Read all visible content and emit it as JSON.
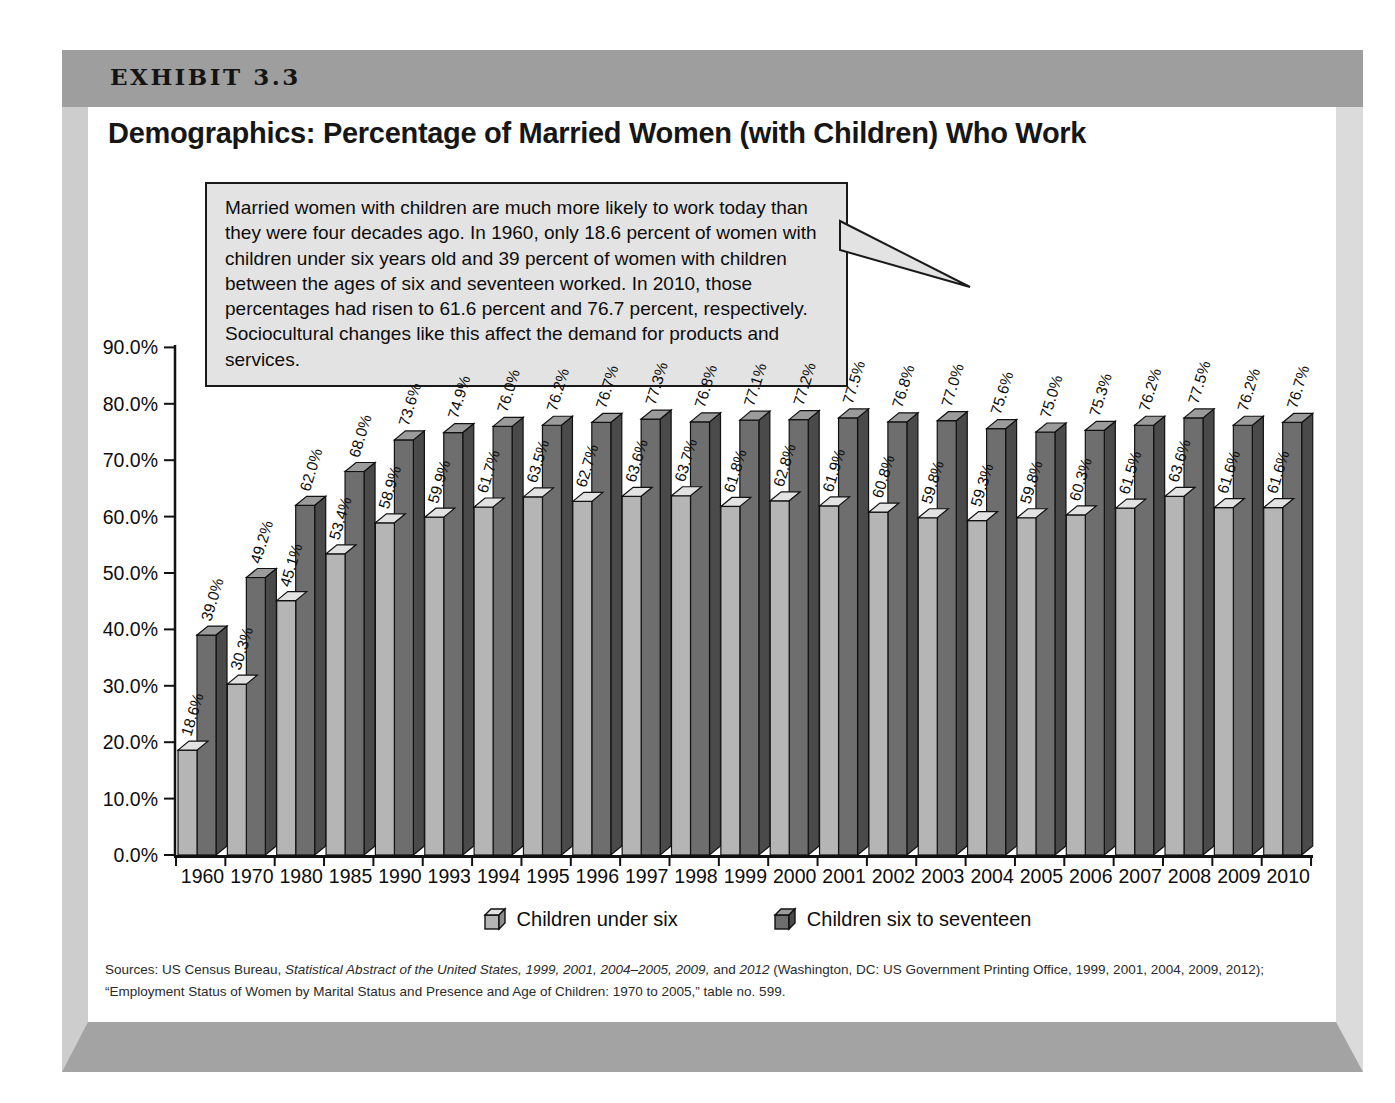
{
  "exhibit": {
    "label": "EXHIBIT 3.3"
  },
  "title": "Demographics: Percentage of Married Women (with Children) Who Work",
  "callout": {
    "text": "Married women with children are much more likely to work today than they were four decades ago. In 1960, only 18.6 percent of women with children under six years old and 39 percent of women with children between the ages of six and seventeen worked. In 2010, those percentages had risen to 61.6 percent and 76.7 percent, respectively. Sociocultural changes like this affect the demand for products and services."
  },
  "chart_data": {
    "type": "bar",
    "title": "Demographics: Percentage of Married Women (with Children) Who Work",
    "categories": [
      "1960",
      "1970",
      "1980",
      "1985",
      "1990",
      "1993",
      "1994",
      "1995",
      "1996",
      "1997",
      "1998",
      "1999",
      "2000",
      "2001",
      "2002",
      "2003",
      "2004",
      "2005",
      "2006",
      "2007",
      "2008",
      "2009",
      "2010"
    ],
    "series": [
      {
        "name": "Children under six",
        "color": "#b5b5b5",
        "top_color": "#e2e2e2",
        "side_color": "#8e8e8e",
        "values": [
          18.6,
          30.3,
          45.1,
          53.4,
          58.9,
          59.9,
          61.7,
          63.5,
          62.7,
          63.6,
          63.7,
          61.8,
          62.8,
          61.9,
          60.8,
          59.8,
          59.3,
          59.8,
          60.3,
          61.5,
          63.6,
          61.6,
          61.6
        ]
      },
      {
        "name": "Children six to seventeen",
        "color": "#6e6e6e",
        "top_color": "#9b9b9b",
        "side_color": "#4a4a4a",
        "values": [
          39.0,
          49.2,
          62.0,
          68.0,
          73.6,
          74.9,
          76.0,
          76.2,
          76.7,
          77.3,
          76.8,
          77.1,
          77.2,
          77.5,
          76.8,
          77.0,
          75.6,
          75.0,
          75.3,
          76.2,
          77.5,
          76.2,
          76.7
        ]
      }
    ],
    "ylim": [
      0,
      90
    ],
    "yticks": [
      "0.0%",
      "10.0%",
      "20.0%",
      "30.0%",
      "40.0%",
      "50.0%",
      "60.0%",
      "70.0%",
      "80.0%",
      "90.0%"
    ],
    "grid": false,
    "legend_position": "bottom",
    "value_labels": "rotated percentage label above every bar",
    "bar_style": "3d-clustered",
    "outline_color": "#111111"
  },
  "sources": {
    "segments": [
      {
        "text": "Sources: US Census Bureau, ",
        "italic": false
      },
      {
        "text": "Statistical Abstract of the United States, 1999, 2001, 2004–2005, 2009,",
        "italic": true
      },
      {
        "text": " and ",
        "italic": false
      },
      {
        "text": "2012",
        "italic": true
      },
      {
        "text": " (Washington, DC: US Government Printing Office, 1999, 2001, 2004, 2009, 2012); “Employment Status of Women by Marital Status and Presence and Age of Children: 1970 to 2005,” table no. 599.",
        "italic": false
      }
    ]
  }
}
